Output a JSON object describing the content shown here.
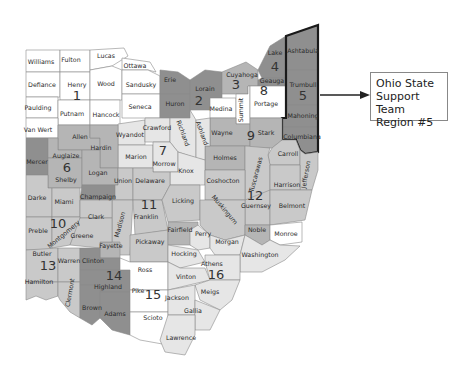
{
  "callout": {
    "line1": "Ohio State",
    "line2": "Support Team",
    "line3": "Region #5"
  },
  "colors": {
    "white": "#ffffff",
    "light": "#e6e6e6",
    "medium": "#c9c9c9",
    "mid_dark": "#b5b5b5",
    "dark": "#8f8f8f",
    "region5_border": "#1a1a1a",
    "arrow": "#222222"
  },
  "regions": [
    {
      "id": "1",
      "label": "1",
      "counties": [
        "Williams",
        "Fulton",
        "Lucas",
        "Defiance",
        "Henry",
        "Wood",
        "Ottawa",
        "Sandusky",
        "Paulding",
        "Putnam",
        "Hancock",
        "Seneca",
        "Van Wert"
      ]
    },
    {
      "id": "2",
      "label": "2",
      "counties": [
        "Erie",
        "Huron",
        "Lorain"
      ]
    },
    {
      "id": "3",
      "label": "3",
      "counties": [
        "Cuyahoga"
      ]
    },
    {
      "id": "4",
      "label": "4",
      "counties": [
        "Lake",
        "Geauga"
      ]
    },
    {
      "id": "5",
      "label": "5",
      "counties": [
        "Ashtabula",
        "Trumbull",
        "Mahoning",
        "Columbiana"
      ]
    },
    {
      "id": "6",
      "label": "6",
      "counties": [
        "Allen",
        "Mercer",
        "Auglaize",
        "Hardin",
        "Shelby",
        "Logan",
        "Champaign"
      ]
    },
    {
      "id": "7",
      "label": "7",
      "counties": [
        "Wyandot",
        "Crawford",
        "Marion",
        "Morrow",
        "Richland",
        "Ashland",
        "Knox"
      ]
    },
    {
      "id": "8",
      "label": "8",
      "counties": [
        "Medina",
        "Summit",
        "Portage"
      ]
    },
    {
      "id": "9",
      "label": "9",
      "counties": [
        "Wayne",
        "Stark",
        "Holmes"
      ]
    },
    {
      "id": "10",
      "label": "10",
      "counties": [
        "Darke",
        "Miami",
        "Preble",
        "Montgomery",
        "Clark",
        "Greene"
      ]
    },
    {
      "id": "11",
      "label": "11",
      "counties": [
        "Union",
        "Delaware",
        "Madison",
        "Franklin",
        "Licking",
        "Fayette",
        "Pickaway",
        "Fairfield"
      ]
    },
    {
      "id": "12",
      "label": "12",
      "counties": [
        "Carroll",
        "Tuscarawas",
        "Jefferson",
        "Harrison",
        "Coshocton",
        "Guernsey",
        "Belmont",
        "Muskingum",
        "Noble"
      ]
    },
    {
      "id": "13",
      "label": "13",
      "counties": [
        "Butler",
        "Warren",
        "Hamilton",
        "Clermont"
      ]
    },
    {
      "id": "14",
      "label": "14",
      "counties": [
        "Clinton",
        "Highland",
        "Brown",
        "Adams"
      ]
    },
    {
      "id": "15",
      "label": "15",
      "counties": [
        "Ross",
        "Pike",
        "Scioto"
      ]
    },
    {
      "id": "16",
      "label": "16",
      "counties": [
        "Perry",
        "Morgan",
        "Monroe",
        "Washington",
        "Hocking",
        "Athens",
        "Vinton",
        "Meigs",
        "Jackson",
        "Gallia",
        "Lawrence"
      ]
    }
  ],
  "county_labels": {
    "williams": "Williams",
    "fulton": "Fulton",
    "lucas": "Lucas",
    "ottawa": "Ottawa",
    "defiance": "Defiance",
    "henry": "Henry",
    "wood": "Wood",
    "sandusky": "Sandusky",
    "paulding": "Paulding",
    "putnam": "Putnam",
    "hancock": "Hancock",
    "seneca": "Seneca",
    "vanwert": "Van Wert",
    "erie": "Erie",
    "huron": "Huron",
    "lorain": "Lorain",
    "cuyahoga": "Cuyahoga",
    "lake": "Lake",
    "geauga": "Geauga",
    "ashtabula": "Ashtabula",
    "trumbull": "Trumbull",
    "mahoning": "Mahoning",
    "columbiana": "Columbiana",
    "medina": "Medina",
    "summit": "Summit",
    "portage": "Portage",
    "wayne": "Wayne",
    "stark": "Stark",
    "wyandot": "Wyandot",
    "crawford": "Crawford",
    "richland": "Richland",
    "ashland": "Ashland",
    "allen": "Allen",
    "hardin": "Hardin",
    "mercer": "Mercer",
    "auglaize": "Auglaize",
    "shelby": "Shelby",
    "logan": "Logan",
    "marion": "Marion",
    "morrow": "Morrow",
    "knox": "Knox",
    "holmes": "Holmes",
    "carroll": "Carroll",
    "tuscarawas": "Tuscarawas",
    "jefferson": "Jefferson",
    "coshocton": "Coshocton",
    "harrison": "Harrison",
    "union": "Union",
    "delaware": "Delaware",
    "champaign": "Champaign",
    "darke": "Darke",
    "miami": "Miami",
    "clark": "Clark",
    "madison": "Madison",
    "franklin": "Franklin",
    "licking": "Licking",
    "muskingum": "Muskingum",
    "guernsey": "Guernsey",
    "belmont": "Belmont",
    "preble": "Preble",
    "montgomery": "Montgomery",
    "greene": "Greene",
    "fayette": "Fayette",
    "pickaway": "Pickaway",
    "fairfield": "Fairfield",
    "perry": "Perry",
    "noble": "Noble",
    "monroe": "Monroe",
    "morgan": "Morgan",
    "washington": "Washington",
    "butler": "Butler",
    "warren": "Warren",
    "clinton": "Clinton",
    "hamilton": "Hamilton",
    "clermont": "Clermont",
    "highland": "Highland",
    "brown": "Brown",
    "adams": "Adams",
    "ross": "Ross",
    "hocking": "Hocking",
    "athens": "Athens",
    "vinton": "Vinton",
    "pike": "Pike",
    "jackson": "Jackson",
    "meigs": "Meigs",
    "scioto": "Scioto",
    "gallia": "Gallia",
    "lawrence": "Lawrence"
  }
}
